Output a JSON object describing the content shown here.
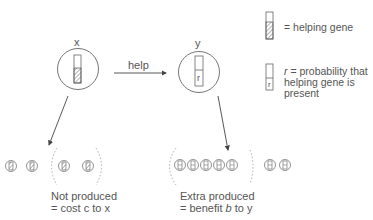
{
  "individuals": {
    "x": {
      "label": "x"
    },
    "y": {
      "label": "y",
      "gene_mark": "r"
    }
  },
  "arrow": {
    "label": "help"
  },
  "legend": {
    "helping_gene": {
      "text": "= helping gene"
    },
    "probability": {
      "mark": "r",
      "line1_var": "r",
      "line1_rest": " = probability that",
      "line2": "helping gene is",
      "line3": "present"
    }
  },
  "offspring_x": {
    "count_outside": 2,
    "count_inside": 2,
    "caption_line1": "Not produced",
    "caption_line2": "= cost c to x"
  },
  "offspring_y": {
    "count_inside": 5,
    "count_outside": 2,
    "caption_line1": "Extra produced",
    "caption_line2_pre": "= benefit ",
    "caption_line2_var": "b",
    "caption_line2_post": " to y"
  },
  "colors": {
    "stroke": "#666666",
    "text": "#555555",
    "dashed": "#999999"
  }
}
